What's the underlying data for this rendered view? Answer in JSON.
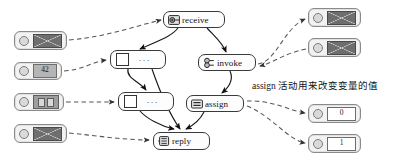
{
  "diagram": {
    "type": "bpel-process-flow",
    "annotation": "assign 活动用来改变变量的值",
    "activities": [
      {
        "id": "receive",
        "label": "receive",
        "icon": "receive-activity-icon",
        "x": 163,
        "y": 11,
        "w": 62,
        "h": 17
      },
      {
        "id": "invoke",
        "label": "invoke",
        "icon": "invoke-activity-icon",
        "x": 198,
        "y": 54,
        "w": 58,
        "h": 17
      },
      {
        "id": "assign",
        "label": "assign",
        "icon": "assign-activity-icon",
        "x": 186,
        "y": 95,
        "w": 58,
        "h": 17
      },
      {
        "id": "reply",
        "label": "reply",
        "icon": "reply-activity-icon",
        "x": 153,
        "y": 132,
        "w": 57,
        "h": 18
      }
    ],
    "scopes": [
      {
        "id": "scope-upper",
        "dots": "···",
        "x": 110,
        "y": 50,
        "w": 56,
        "h": 19
      },
      {
        "id": "scope-lower",
        "dots": "···",
        "x": 118,
        "y": 92,
        "w": 56,
        "h": 19
      }
    ],
    "variables_left": [
      {
        "id": "var-in-message-1",
        "payload": "envelope",
        "value": "",
        "x": 14,
        "y": 31,
        "w": 53,
        "h": 19
      },
      {
        "id": "var-number-42",
        "payload": "number",
        "value": "42",
        "x": 14,
        "y": 62,
        "w": 48,
        "h": 18
      },
      {
        "id": "var-array-pair",
        "payload": "pair",
        "value": "",
        "x": 14,
        "y": 93,
        "w": 50,
        "h": 18
      },
      {
        "id": "var-in-message-2",
        "payload": "envelope",
        "value": "",
        "x": 14,
        "y": 124,
        "w": 53,
        "h": 19
      }
    ],
    "variables_right": [
      {
        "id": "var-out-message-1",
        "payload": "envelope",
        "value": "",
        "x": 308,
        "y": 8,
        "w": 53,
        "h": 19
      },
      {
        "id": "var-out-message-2",
        "payload": "envelope",
        "value": "",
        "x": 308,
        "y": 38,
        "w": 53,
        "h": 19
      },
      {
        "id": "var-number-0",
        "payload": "number",
        "value": "0",
        "x": 308,
        "y": 104,
        "w": 53,
        "h": 19
      },
      {
        "id": "var-number-1",
        "payload": "number",
        "value": "1",
        "x": 308,
        "y": 134,
        "w": 53,
        "h": 19
      }
    ],
    "colors": {
      "node_border": "#3a3a3a",
      "node_fill": "#fdfdfd",
      "varbox_border": "#8a8a8a",
      "varbox_fill": "#f2f2f2",
      "envelope": "#6e6e6e",
      "flow_solid": "#1a1a1a",
      "flow_dashed": "#555555"
    }
  }
}
